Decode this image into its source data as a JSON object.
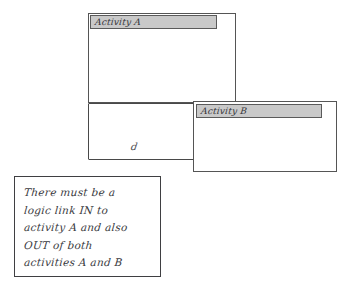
{
  "canvas": {
    "width": 350,
    "height": 288,
    "background": "#ffffff",
    "ink_color": "#3f3f42",
    "titlebar_color": "#c9c9c9"
  },
  "diagram": {
    "type": "hand-drawn-sketch",
    "activities": [
      {
        "id": "activity-a",
        "title": "Activity A",
        "titlebar_fill": "#c9c9c9",
        "box": {
          "x": 88,
          "y": 13,
          "width": 148,
          "height": 90
        },
        "titlebar": {
          "x": 90,
          "y": 15,
          "width": 127,
          "height": 14
        }
      },
      {
        "id": "activity-b",
        "title": "Activity B",
        "titlebar_fill": "#c9c9c9",
        "box": {
          "x": 193,
          "y": 101,
          "width": 144,
          "height": 71
        },
        "titlebar": {
          "x": 196,
          "y": 104,
          "width": 126,
          "height": 14
        }
      }
    ],
    "outer_frame": {
      "x": 88,
      "y": 103,
      "width": 108,
      "height": 57
    },
    "stray_mark": {
      "text": "d",
      "x": 131,
      "y": 141
    }
  },
  "note": {
    "box": {
      "x": 14,
      "y": 176,
      "width": 147,
      "height": 101
    },
    "lines": [
      "There must be a",
      "logic link IN to",
      "activity A and also",
      "OUT of both",
      "activities A and B"
    ],
    "full_text": "There must be a logic link IN to activity A and also OUT of both activities A and B"
  }
}
